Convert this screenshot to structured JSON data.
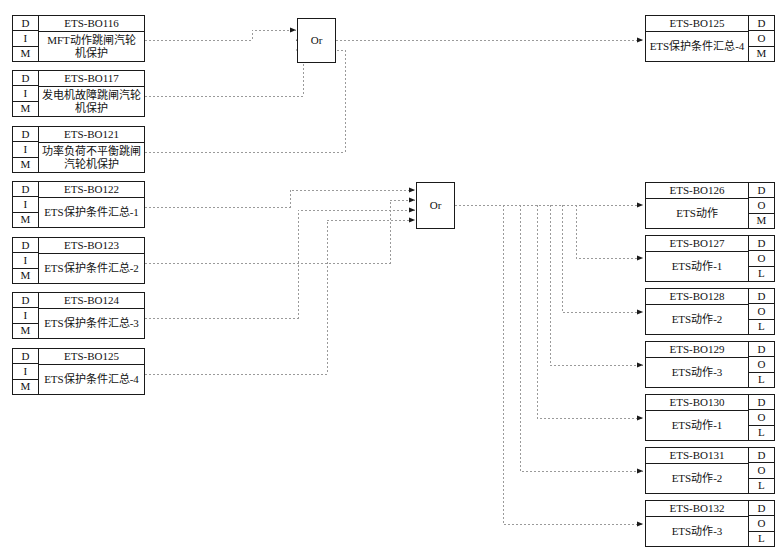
{
  "diagram": {
    "caption": "",
    "colors": {
      "line": "#9a9a9a",
      "border": "#1a1a1a",
      "background": "#ffffff"
    },
    "gate_label": "Or",
    "tags": {
      "left": [
        "D",
        "I",
        "M"
      ],
      "right_m": [
        "D",
        "O",
        "M"
      ],
      "right_l": [
        "D",
        "O",
        "L"
      ]
    }
  },
  "inputs": [
    {
      "id": "ETS-BO116",
      "desc": "MFT动作跳闸汽轮机保护",
      "tags": [
        "D",
        "I",
        "M"
      ]
    },
    {
      "id": "ETS-BO117",
      "desc": "发电机故障跳闸汽轮机保护",
      "tags": [
        "D",
        "I",
        "M"
      ]
    },
    {
      "id": "ETS-BO121",
      "desc": "功率负荷不平衡跳闸汽轮机保护",
      "tags": [
        "D",
        "I",
        "M"
      ]
    },
    {
      "id": "ETS-BO122",
      "desc": "ETS保护条件汇总-1",
      "tags": [
        "D",
        "I",
        "M"
      ]
    },
    {
      "id": "ETS-BO123",
      "desc": "ETS保护条件汇总-2",
      "tags": [
        "D",
        "I",
        "M"
      ]
    },
    {
      "id": "ETS-BO124",
      "desc": "ETS保护条件汇总-3",
      "tags": [
        "D",
        "I",
        "M"
      ]
    },
    {
      "id": "ETS-BO125",
      "desc": "ETS保护条件汇总-4",
      "tags": [
        "D",
        "I",
        "M"
      ]
    }
  ],
  "gates": [
    {
      "name": "or-gate-1",
      "label": "Or",
      "inputs": 3
    },
    {
      "name": "or-gate-2",
      "label": "Or",
      "inputs": 4
    }
  ],
  "outputs_top": [
    {
      "id": "ETS-BO125",
      "desc": "ETS保护条件汇总-4",
      "tags": [
        "D",
        "O",
        "M"
      ]
    }
  ],
  "outputs": [
    {
      "id": "ETS-BO126",
      "desc": "ETS动作",
      "tags": [
        "D",
        "O",
        "M"
      ]
    },
    {
      "id": "ETS-BO127",
      "desc": "ETS动作-1",
      "tags": [
        "D",
        "O",
        "L"
      ]
    },
    {
      "id": "ETS-BO128",
      "desc": "ETS动作-2",
      "tags": [
        "D",
        "O",
        "L"
      ]
    },
    {
      "id": "ETS-BO129",
      "desc": "ETS动作-3",
      "tags": [
        "D",
        "O",
        "L"
      ]
    },
    {
      "id": "ETS-BO130",
      "desc": "ETS动作-1",
      "tags": [
        "D",
        "O",
        "L"
      ]
    },
    {
      "id": "ETS-BO131",
      "desc": "ETS动作-2",
      "tags": [
        "D",
        "O",
        "L"
      ]
    },
    {
      "id": "ETS-BO132",
      "desc": "ETS动作-3",
      "tags": [
        "D",
        "O",
        "L"
      ]
    }
  ]
}
